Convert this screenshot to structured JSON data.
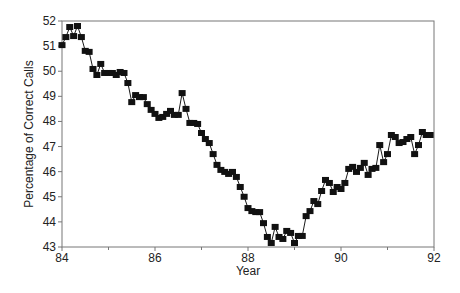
{
  "chart_data": {
    "type": "line",
    "title": "",
    "xlabel": "Year",
    "ylabel": "Percentage of Correct Calls",
    "xlim": [
      84,
      92
    ],
    "ylim": [
      43,
      52
    ],
    "x_ticks": [
      84,
      86,
      88,
      90,
      92
    ],
    "x_minor_ticks": [
      85,
      87,
      89,
      91
    ],
    "y_ticks": [
      43,
      44,
      45,
      46,
      47,
      48,
      49,
      50,
      51,
      52
    ],
    "grid": false,
    "legend": null,
    "marker": "square",
    "series": [
      {
        "name": "Percentage of Correct Calls",
        "x_start": 84.0,
        "x_step_months": 1,
        "values": [
          51.04,
          51.36,
          51.76,
          51.4,
          51.8,
          51.36,
          50.81,
          50.77,
          50.09,
          49.85,
          50.29,
          49.93,
          49.93,
          49.93,
          49.85,
          49.97,
          49.93,
          49.53,
          48.77,
          49.05,
          48.97,
          48.97,
          48.69,
          48.46,
          48.3,
          48.14,
          48.18,
          48.3,
          48.42,
          48.26,
          48.26,
          49.13,
          48.5,
          47.94,
          47.94,
          47.9,
          47.54,
          47.3,
          47.14,
          46.7,
          46.27,
          46.07,
          45.99,
          45.91,
          45.99,
          45.79,
          45.39,
          45.0,
          44.55,
          44.43,
          44.39,
          44.39,
          43.95,
          43.4,
          43.16,
          43.8,
          43.4,
          43.32,
          43.64,
          43.56,
          43.16,
          43.44,
          43.44,
          44.23,
          44.43,
          44.83,
          44.71,
          45.23,
          45.67,
          45.55,
          45.19,
          45.39,
          45.31,
          45.55,
          46.11,
          46.19,
          45.99,
          46.15,
          46.35,
          45.87,
          46.11,
          46.15,
          47.06,
          46.38,
          46.7,
          47.46,
          47.38,
          47.14,
          47.18,
          47.3,
          47.38,
          46.7,
          47.06,
          47.58,
          47.46,
          47.46
        ]
      }
    ]
  },
  "colors": {
    "line": "#1a1a1a",
    "marker": "#111111",
    "axis": "#777777",
    "text": "#222222"
  }
}
